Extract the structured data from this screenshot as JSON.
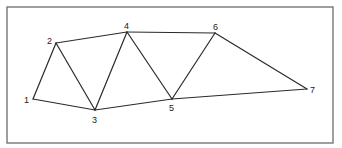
{
  "diagram": {
    "type": "graph",
    "frame": {
      "x": 7,
      "y": 7,
      "width": 326,
      "height": 136
    },
    "nodes": [
      {
        "id": "1",
        "label": "1",
        "x": 33,
        "y": 99,
        "lx": 24,
        "ly": 103
      },
      {
        "id": "2",
        "label": "2",
        "x": 56,
        "y": 43,
        "lx": 47,
        "ly": 44
      },
      {
        "id": "3",
        "label": "3",
        "x": 95,
        "y": 110,
        "lx": 92,
        "ly": 123
      },
      {
        "id": "4",
        "label": "4",
        "x": 127,
        "y": 32,
        "lx": 124,
        "ly": 29
      },
      {
        "id": "5",
        "label": "5",
        "x": 172,
        "y": 99,
        "lx": 169,
        "ly": 111
      },
      {
        "id": "6",
        "label": "6",
        "x": 215,
        "y": 33,
        "lx": 213,
        "ly": 30
      },
      {
        "id": "7",
        "label": "7",
        "x": 307,
        "y": 89,
        "lx": 310,
        "ly": 93
      }
    ],
    "edges": [
      [
        "1",
        "2"
      ],
      [
        "1",
        "3"
      ],
      [
        "2",
        "3"
      ],
      [
        "2",
        "4"
      ],
      [
        "3",
        "4"
      ],
      [
        "3",
        "5"
      ],
      [
        "4",
        "5"
      ],
      [
        "4",
        "6"
      ],
      [
        "5",
        "6"
      ],
      [
        "5",
        "7"
      ],
      [
        "6",
        "7"
      ]
    ]
  }
}
